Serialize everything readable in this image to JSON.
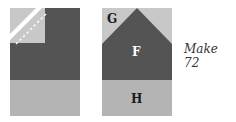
{
  "diagram": {
    "left_block": {
      "description": "Sewn unit: dark rectangle with light corner square and dashed seam line, light gray bottom strip",
      "colors": {
        "dark": "#545454",
        "light_square": "#c8c8c8",
        "bottom": "#b4b4b4",
        "seam": "#ffffff"
      }
    },
    "right_block": {
      "pieces": [
        {
          "id": "G",
          "label": "G",
          "color": "#c8c8c8"
        },
        {
          "id": "F",
          "label": "F",
          "color": "#545454"
        },
        {
          "id": "H",
          "label": "H",
          "color": "#b4b4b4"
        }
      ]
    },
    "caption": "Make 72"
  }
}
